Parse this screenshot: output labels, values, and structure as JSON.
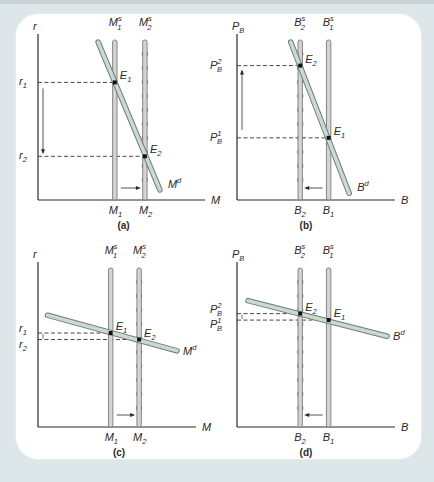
{
  "chart_data": [
    {
      "type": "line",
      "panel": "a",
      "caption": "(a)",
      "ylabel": {
        "base": "r",
        "sub": "",
        "sup": ""
      },
      "xlabel": {
        "base": "M",
        "sub": "",
        "sup": ""
      },
      "supply": [
        {
          "name": "M1s",
          "label": {
            "base": "M",
            "sup": "s",
            "sub": "1"
          },
          "x_label": {
            "base": "M",
            "sub": "1"
          },
          "x": 0.46,
          "style": "solid"
        },
        {
          "name": "M2s",
          "label": {
            "base": "M",
            "sup": "s",
            "sub": "2"
          },
          "x_label": {
            "base": "M",
            "sub": "2"
          },
          "x": 0.64,
          "style": "beaded"
        }
      ],
      "demand": {
        "label": {
          "base": "M",
          "sup": "d"
        },
        "from": [
          0.36,
          0.94
        ],
        "to": [
          0.73,
          0.06
        ]
      },
      "equilibria": [
        {
          "label": {
            "base": "E",
            "sub": "1"
          },
          "x": 0.46,
          "y": 0.7,
          "level": {
            "base": "r",
            "sub": "1",
            "sup": ""
          }
        },
        {
          "label": {
            "base": "E",
            "sub": "2"
          },
          "x": 0.64,
          "y": 0.26,
          "level": {
            "base": "r",
            "sub": "2",
            "sup": ""
          }
        }
      ],
      "shift_arrow": "right",
      "level_arrow": "down"
    },
    {
      "type": "line",
      "panel": "b",
      "caption": "(b)",
      "ylabel": {
        "base": "P",
        "sub": "B",
        "sup": ""
      },
      "xlabel": {
        "base": "B",
        "sub": "",
        "sup": ""
      },
      "supply": [
        {
          "name": "B2s",
          "label": {
            "base": "B",
            "sup": "s",
            "sub": "2"
          },
          "x_label": {
            "base": "B",
            "sub": "2"
          },
          "x": 0.4,
          "style": "beaded"
        },
        {
          "name": "B1s",
          "label": {
            "base": "B",
            "sup": "s",
            "sub": "1"
          },
          "x_label": {
            "base": "B",
            "sub": "1"
          },
          "x": 0.58,
          "style": "solid"
        }
      ],
      "demand": {
        "label": {
          "base": "B",
          "sup": "d"
        },
        "from": [
          0.34,
          0.94
        ],
        "to": [
          0.71,
          0.04
        ]
      },
      "equilibria": [
        {
          "label": {
            "base": "E",
            "sub": "2"
          },
          "x": 0.4,
          "y": 0.8,
          "level": {
            "base": "P",
            "sub": "B",
            "sup": "2"
          }
        },
        {
          "label": {
            "base": "E",
            "sub": "1"
          },
          "x": 0.58,
          "y": 0.37,
          "level": {
            "base": "P",
            "sub": "B",
            "sup": "1"
          }
        }
      ],
      "shift_arrow": "left",
      "level_arrow": "up"
    },
    {
      "type": "line",
      "panel": "c",
      "caption": "(c)",
      "ylabel": {
        "base": "r",
        "sub": "",
        "sup": ""
      },
      "xlabel": {
        "base": "M",
        "sub": "",
        "sup": ""
      },
      "supply": [
        {
          "name": "M1s",
          "label": {
            "base": "M",
            "sup": "s",
            "sub": "1"
          },
          "x_label": {
            "base": "M",
            "sub": "1"
          },
          "x": 0.46,
          "style": "solid"
        },
        {
          "name": "M2s",
          "label": {
            "base": "M",
            "sup": "s",
            "sub": "2"
          },
          "x_label": {
            "base": "M",
            "sub": "2"
          },
          "x": 0.64,
          "style": "beaded"
        }
      ],
      "demand": {
        "label": {
          "base": "M",
          "sup": "d"
        },
        "from": [
          0.06,
          0.69
        ],
        "to": [
          0.88,
          0.47
        ]
      },
      "equilibria": [
        {
          "label": {
            "base": "E",
            "sub": "1"
          },
          "x": 0.46,
          "y": 0.58,
          "level": {
            "base": "r",
            "sub": "1",
            "sup": ""
          }
        },
        {
          "label": {
            "base": "E",
            "sub": "2"
          },
          "x": 0.64,
          "y": 0.54,
          "level": {
            "base": "r",
            "sub": "2",
            "sup": ""
          }
        }
      ],
      "shift_arrow": "right",
      "level_arrow": "down"
    },
    {
      "type": "line",
      "panel": "d",
      "caption": "(d)",
      "ylabel": {
        "base": "P",
        "sub": "B",
        "sup": ""
      },
      "xlabel": {
        "base": "B",
        "sub": "",
        "sup": ""
      },
      "supply": [
        {
          "name": "B2s",
          "label": {
            "base": "B",
            "sup": "s",
            "sub": "2"
          },
          "x_label": {
            "base": "B",
            "sub": "2"
          },
          "x": 0.4,
          "style": "beaded"
        },
        {
          "name": "B1s",
          "label": {
            "base": "B",
            "sup": "s",
            "sub": "1"
          },
          "x_label": {
            "base": "B",
            "sub": "1"
          },
          "x": 0.58,
          "style": "solid"
        }
      ],
      "demand": {
        "label": {
          "base": "B",
          "sup": "d"
        },
        "from": [
          0.07,
          0.78
        ],
        "to": [
          0.95,
          0.56
        ]
      },
      "equilibria": [
        {
          "label": {
            "base": "E",
            "sub": "2"
          },
          "x": 0.4,
          "y": 0.7,
          "level": {
            "base": "P",
            "sub": "B",
            "sup": "2"
          }
        },
        {
          "label": {
            "base": "E",
            "sub": "1"
          },
          "x": 0.58,
          "y": 0.66,
          "level": {
            "base": "P",
            "sub": "B",
            "sup": "1"
          }
        }
      ],
      "shift_arrow": "left",
      "level_arrow": "up"
    }
  ],
  "colors": {
    "background": "#dde6e9",
    "panel": "#ffffff",
    "axis": "#2a2a2a",
    "demand_fill": "#c9dad2",
    "demand_stroke": "#6f7a76",
    "supply_fill": "#d4d4d4",
    "supply_stroke": "#7a7a7a",
    "dash": "#333333"
  }
}
